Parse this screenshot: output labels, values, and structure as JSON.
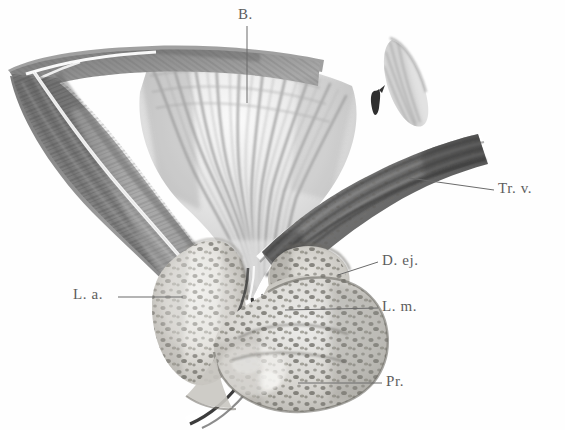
{
  "figure": {
    "medium": "grayscale anatomical lithograph",
    "background_color": "#fefefe",
    "ink_color": "#5d5d5d"
  },
  "labels": [
    {
      "id": "B",
      "text": "B.",
      "meaning": "Bladder (Vesica urinaria)",
      "x": 238,
      "y": 6,
      "leader": {
        "x1": 247,
        "y1": 26,
        "x2": 247,
        "y2": 103
      }
    },
    {
      "id": "Trv",
      "text": "Tr. v.",
      "meaning": "Trigonum vesicae / vas deferens band",
      "x": 498,
      "y": 180,
      "leader": {
        "x1": 494,
        "y1": 190,
        "x2": 409,
        "y2": 178
      }
    },
    {
      "id": "Dej",
      "text": "D. ej.",
      "meaning": "Ductus ejaculatorius",
      "x": 382,
      "y": 252,
      "leader": {
        "x1": 378,
        "y1": 262,
        "x2": 338,
        "y2": 275
      }
    },
    {
      "id": "La",
      "text": "L. a.",
      "meaning": "Lobus anterior",
      "x": 73,
      "y": 286,
      "leader": {
        "x1": 118,
        "y1": 297,
        "x2": 183,
        "y2": 297
      }
    },
    {
      "id": "Lm",
      "text": "L. m.",
      "meaning": "Lobus medius",
      "x": 382,
      "y": 298,
      "leader": {
        "x1": 378,
        "y1": 308,
        "x2": 285,
        "y2": 310
      }
    },
    {
      "id": "Pr",
      "text": "Pr.",
      "meaning": "Prostata",
      "x": 386,
      "y": 373,
      "leader": {
        "x1": 382,
        "y1": 383,
        "x2": 298,
        "y2": 383
      }
    }
  ],
  "structures": [
    {
      "id": "bladder-wall-left",
      "name": "bladder wall, left / anterior"
    },
    {
      "id": "bladder-lumen",
      "name": "bladder lumen with rugae"
    },
    {
      "id": "trigone-fragment",
      "name": "upper right mucosal fragment"
    },
    {
      "id": "ureteric-orifice",
      "name": "small dark orifice mark"
    },
    {
      "id": "vas-deferens-band",
      "name": "dark oblique muscular band (Tr. v.)"
    },
    {
      "id": "ejaculatory-duct",
      "name": "ejaculatory duct mass"
    },
    {
      "id": "anterior-lobe",
      "name": "anterior prostatic lobe (L. a.)"
    },
    {
      "id": "middle-lobe",
      "name": "middle prostatic lobe (L. m.)"
    },
    {
      "id": "prostate-body",
      "name": "prostate gland body (Pr.)"
    },
    {
      "id": "urethra-channel",
      "name": "prostatic urethra channel"
    }
  ]
}
